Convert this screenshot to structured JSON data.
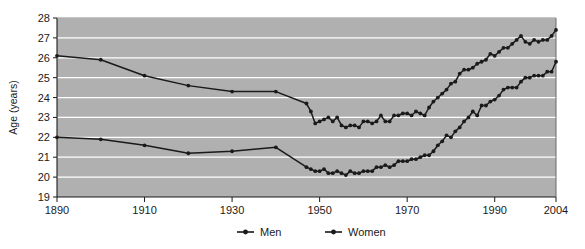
{
  "chart_data": {
    "type": "line",
    "title": "",
    "xlabel": "",
    "ylabel": "Age (years)",
    "ylim": [
      19,
      28
    ],
    "xlim": [
      1890,
      2004
    ],
    "grid": true,
    "grid_axis": "y",
    "legend_position": "bottom",
    "y_ticks": [
      19,
      20,
      21,
      22,
      23,
      24,
      25,
      26,
      27,
      28
    ],
    "x_ticks": [
      1890,
      1910,
      1930,
      1950,
      1970,
      1990,
      2004
    ],
    "plot_background": "#b0b0b0",
    "gridline_color": "#ffffff",
    "series": [
      {
        "name": "Men",
        "color": "#1a1a1a",
        "x": [
          1890,
          1900,
          1910,
          1920,
          1930,
          1940,
          1947,
          1948,
          1949,
          1950,
          1951,
          1952,
          1953,
          1954,
          1955,
          1956,
          1957,
          1958,
          1959,
          1960,
          1961,
          1962,
          1963,
          1964,
          1965,
          1966,
          1967,
          1968,
          1969,
          1970,
          1971,
          1972,
          1973,
          1974,
          1975,
          1976,
          1977,
          1978,
          1979,
          1980,
          1981,
          1982,
          1983,
          1984,
          1985,
          1986,
          1987,
          1988,
          1989,
          1990,
          1991,
          1992,
          1993,
          1994,
          1995,
          1996,
          1997,
          1998,
          1999,
          2000,
          2001,
          2002,
          2003,
          2004
        ],
        "y": [
          26.1,
          25.9,
          25.1,
          24.6,
          24.3,
          24.3,
          23.7,
          23.3,
          22.7,
          22.8,
          22.9,
          23.0,
          22.8,
          23.0,
          22.6,
          22.5,
          22.6,
          22.6,
          22.5,
          22.8,
          22.8,
          22.7,
          22.8,
          23.1,
          22.8,
          22.8,
          23.1,
          23.1,
          23.2,
          23.2,
          23.1,
          23.3,
          23.2,
          23.1,
          23.5,
          23.8,
          24.0,
          24.2,
          24.4,
          24.7,
          24.8,
          25.2,
          25.4,
          25.4,
          25.5,
          25.7,
          25.8,
          25.9,
          26.2,
          26.1,
          26.3,
          26.5,
          26.5,
          26.7,
          26.9,
          27.1,
          26.8,
          26.7,
          26.9,
          26.8,
          26.9,
          26.9,
          27.1,
          27.4
        ]
      },
      {
        "name": "Women",
        "color": "#1a1a1a",
        "x": [
          1890,
          1900,
          1910,
          1920,
          1930,
          1940,
          1947,
          1948,
          1949,
          1950,
          1951,
          1952,
          1953,
          1954,
          1955,
          1956,
          1957,
          1958,
          1959,
          1960,
          1961,
          1962,
          1963,
          1964,
          1965,
          1966,
          1967,
          1968,
          1969,
          1970,
          1971,
          1972,
          1973,
          1974,
          1975,
          1976,
          1977,
          1978,
          1979,
          1980,
          1981,
          1982,
          1983,
          1984,
          1985,
          1986,
          1987,
          1988,
          1989,
          1990,
          1991,
          1992,
          1993,
          1994,
          1995,
          1996,
          1997,
          1998,
          1999,
          2000,
          2001,
          2002,
          2003,
          2004
        ],
        "y": [
          22.0,
          21.9,
          21.6,
          21.2,
          21.3,
          21.5,
          20.5,
          20.4,
          20.3,
          20.3,
          20.4,
          20.2,
          20.2,
          20.3,
          20.2,
          20.1,
          20.3,
          20.2,
          20.2,
          20.3,
          20.3,
          20.3,
          20.5,
          20.5,
          20.6,
          20.5,
          20.6,
          20.8,
          20.8,
          20.8,
          20.9,
          20.9,
          21.0,
          21.1,
          21.1,
          21.3,
          21.6,
          21.8,
          22.1,
          22.0,
          22.3,
          22.5,
          22.8,
          23.0,
          23.3,
          23.1,
          23.6,
          23.6,
          23.8,
          23.9,
          24.1,
          24.4,
          24.5,
          24.5,
          24.5,
          24.8,
          25.0,
          25.0,
          25.1,
          25.1,
          25.1,
          25.3,
          25.3,
          25.8
        ]
      }
    ],
    "legend": [
      {
        "label": "Men",
        "marker": "line-marker-icon"
      },
      {
        "label": "Women",
        "marker": "line-marker-icon"
      }
    ]
  }
}
